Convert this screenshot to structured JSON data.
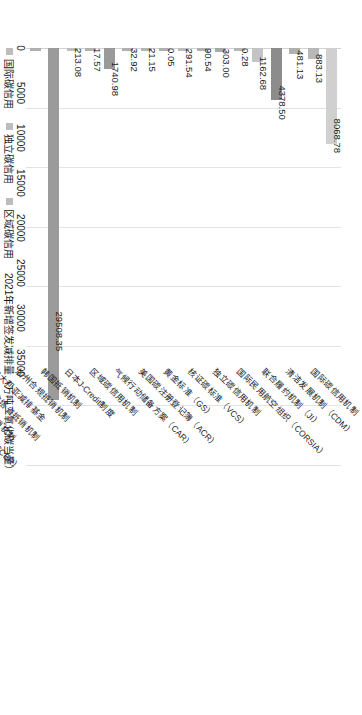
{
  "chart_data": {
    "type": "bar",
    "orientation": "horizontal",
    "title": "",
    "xlabel": "",
    "ylabel": "",
    "axis_label": "2021年新增签发减排量（万吨二氧化碳当量）",
    "xlim": [
      0,
      35000
    ],
    "ticks": [
      "0",
      "5000",
      "10000",
      "15000",
      "20000",
      "25000",
      "30000",
      "35000"
    ],
    "tick_values": [
      0,
      5000,
      10000,
      15000,
      20000,
      25000,
      30000,
      35000
    ],
    "grid": true,
    "legend_position": "bottom",
    "categories": [
      "国际碳信用机制",
      "清洁发展机制（CDM）",
      "联合履约机制（JI）",
      "国际民用航空组织（CORSIA）",
      "独立碳信用机制",
      "核证碳标准（VCS）",
      "黄金标准（GS）",
      "美国碳注册登记簿（ACR）",
      "气候行动储备方案（CAR）",
      "区域碳信用机制",
      "日本J-Credit制度",
      "韩国抵销机制",
      "加州合规抵销机制",
      "澳大利亚减排基金",
      "加拿大艾伯塔省抵销机制",
      "加拿大魁北克省抵销机制",
      "中国国家核证自愿减排量（CCER）"
    ],
    "values": [
      8068.78,
      883.13,
      481.13,
      4378.5,
      1162.68,
      0.28,
      303.0,
      90.54,
      291.54,
      0.05,
      21.15,
      32.92,
      1740.98,
      17.57,
      213.08,
      29508.35,
      0.0
    ],
    "value_labels": [
      "8068.78",
      "883.13",
      "481.13",
      "4378.50",
      "1162.68",
      "0.28",
      "303.00",
      "90.54",
      "291.54",
      "0.05",
      "21.15",
      "32.92",
      "1740.98",
      "17.57",
      "213.08",
      "29508.35",
      ""
    ],
    "bar_colors": [
      "#d0d0d0",
      "#b8b8b8",
      "#b0b0b0",
      "#8c8c8c",
      "#c4c4c4",
      "#b5b5b5",
      "#a8a8a8",
      "#b0b0b0",
      "#bcbcbc",
      "#b0b0b0",
      "#b4b4b4",
      "#b0b0b0",
      "#9a9a9a",
      "#b2b2b2",
      "#bebebe",
      "#9b9b9b",
      "#b0b0b0"
    ],
    "series": [
      {
        "name": "国际碳信用",
        "color": "#bdbdbd"
      },
      {
        "name": "独立碳信用",
        "color": "#bdbdbd"
      },
      {
        "name": "区域碳信用",
        "color": "#bdbdbd"
      }
    ]
  },
  "legend": {
    "items": [
      {
        "label": "国际碳信用",
        "color": "#bdbdbd"
      },
      {
        "label": "独立碳信用",
        "color": "#bdbdbd"
      },
      {
        "label": "区域碳信用",
        "color": "#bdbdbd"
      },
      {
        "label": "2021年新增签发减排量（万吨二氧化碳当量）",
        "color": "transparent"
      }
    ]
  },
  "colors": {
    "grid": "#e3e3e3",
    "axis": "#d2d2d2",
    "text": "#1a1a1a",
    "bar_default": "#b0b0b0"
  }
}
